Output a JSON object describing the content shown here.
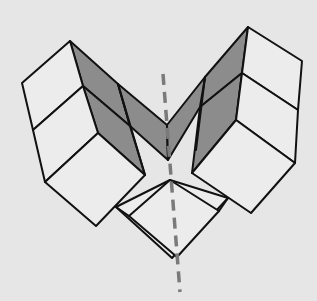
{
  "figure": {
    "colors": {
      "background": "#e6e6e6",
      "line": "#111111",
      "shaded_face": "#8c8c8c",
      "light_face": "#e9e9e9",
      "symmetry_axis": "#7a7a7a"
    },
    "elements": {
      "left_stack": "left-cube-stack",
      "right_stack": "right-cube-stack",
      "center_fold": "shaded-v-fold",
      "bottom_square": "bottom-square",
      "axis": "symmetry-axis-dashed"
    }
  }
}
